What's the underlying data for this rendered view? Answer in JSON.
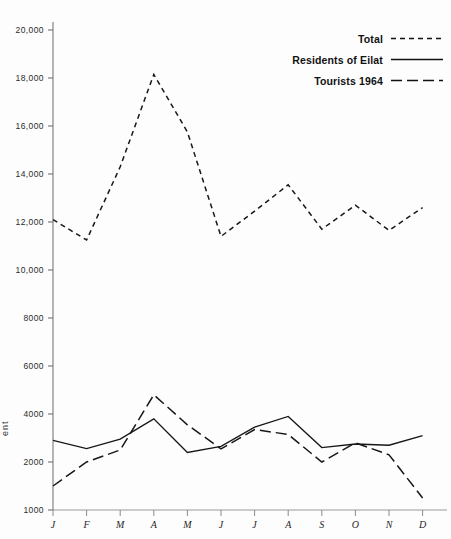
{
  "chart_data": {
    "type": "line",
    "title": "",
    "xlabel": "",
    "ylabel": "",
    "grid": false,
    "legend_position": "top-right",
    "categories": [
      "J",
      "F",
      "M",
      "A",
      "M",
      "J",
      "J",
      "A",
      "S",
      "O",
      "N",
      "D"
    ],
    "category_names": [
      "January",
      "February",
      "March",
      "April",
      "May",
      "June",
      "July",
      "August",
      "September",
      "October",
      "November",
      "December"
    ],
    "ylim": [
      1000,
      20000
    ],
    "yticks": [
      1000,
      2000,
      4000,
      6000,
      8000,
      10000,
      12000,
      14000,
      16000,
      18000,
      20000
    ],
    "ytick_labels": [
      "1000",
      "2000",
      "4000",
      "6000",
      "8000",
      "10,000",
      "12,000",
      "14,000",
      "16,000",
      "18,000",
      "20,000"
    ],
    "series": [
      {
        "name": "Total",
        "style": "dotted",
        "values": [
          12100,
          11250,
          14300,
          18150,
          15750,
          11400,
          12450,
          13550,
          11700,
          12700,
          11650,
          12600
        ]
      },
      {
        "name": "Residents of Eilat",
        "style": "solid",
        "values": [
          2900,
          2560,
          2950,
          3800,
          2400,
          2650,
          3450,
          3900,
          2600,
          2750,
          2700,
          3100
        ]
      },
      {
        "name": "Tourists 1964",
        "style": "dashed",
        "values": [
          1500,
          2000,
          2500,
          4800,
          3550,
          2550,
          3350,
          3150,
          2000,
          2800,
          2300,
          1250
        ]
      }
    ]
  },
  "legend": {
    "items": [
      {
        "label": "Total",
        "style": "dotted"
      },
      {
        "label": "Residents of Eilat",
        "style": "solid"
      },
      {
        "label": "Tourists 1964",
        "style": "dashed"
      }
    ]
  },
  "axis": {
    "y_fragment_label": "ent"
  }
}
